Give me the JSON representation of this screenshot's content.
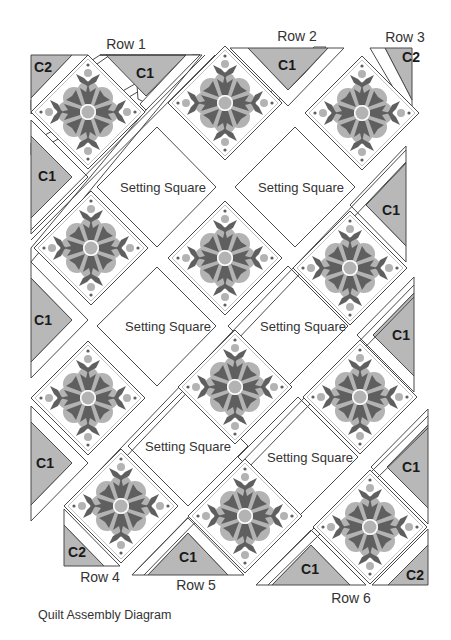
{
  "diagram": {
    "caption": "Quilt Assembly Diagram",
    "colors": {
      "outline": "#4a4a4a",
      "triangle_fill": "#b8b8b8",
      "sashing_fill": "#ffffff",
      "applique_dark": "#5f5f5f",
      "applique_light": "#b3b3b3",
      "block_bg": "#ffffff"
    },
    "row_labels": [
      {
        "text": "Row 1",
        "x": 126,
        "y": 44
      },
      {
        "text": "Row 2",
        "x": 297,
        "y": 36
      },
      {
        "text": "Row 3",
        "x": 405,
        "y": 37
      },
      {
        "text": "Row 4",
        "x": 100,
        "y": 577
      },
      {
        "text": "Row 5",
        "x": 196,
        "y": 585
      },
      {
        "text": "Row 6",
        "x": 351,
        "y": 598
      }
    ],
    "setting_square_label": "Setting Square",
    "setting_squares": [
      {
        "text": "Setting Square",
        "x": 163,
        "y": 187
      },
      {
        "text": "Setting Square",
        "x": 301,
        "y": 187
      },
      {
        "text": "Setting Square",
        "x": 168,
        "y": 326
      },
      {
        "text": "Setting Square",
        "x": 303,
        "y": 326
      },
      {
        "text": "Setting Square",
        "x": 188,
        "y": 446
      },
      {
        "text": "Setting Square",
        "x": 310,
        "y": 457
      }
    ],
    "triangle_labels": [
      {
        "text": "C2",
        "x": 43,
        "y": 67
      },
      {
        "text": "C1",
        "x": 145,
        "y": 73
      },
      {
        "text": "C1",
        "x": 287,
        "y": 65
      },
      {
        "text": "C2",
        "x": 411,
        "y": 57
      },
      {
        "text": "C1",
        "x": 47,
        "y": 176
      },
      {
        "text": "C1",
        "x": 391,
        "y": 210
      },
      {
        "text": "C1",
        "x": 43,
        "y": 320
      },
      {
        "text": "C1",
        "x": 401,
        "y": 335
      },
      {
        "text": "C1",
        "x": 45,
        "y": 463
      },
      {
        "text": "C1",
        "x": 411,
        "y": 467
      },
      {
        "text": "C2",
        "x": 77,
        "y": 552
      },
      {
        "text": "C1",
        "x": 188,
        "y": 557
      },
      {
        "text": "C1",
        "x": 310,
        "y": 569
      },
      {
        "text": "C2",
        "x": 415,
        "y": 575
      }
    ],
    "blocks": [
      {
        "x": 88,
        "y": 112
      },
      {
        "x": 225,
        "y": 103
      },
      {
        "x": 362,
        "y": 113
      },
      {
        "x": 91,
        "y": 248
      },
      {
        "x": 225,
        "y": 258
      },
      {
        "x": 350,
        "y": 268
      },
      {
        "x": 88,
        "y": 398
      },
      {
        "x": 235,
        "y": 387
      },
      {
        "x": 360,
        "y": 397
      },
      {
        "x": 121,
        "y": 506
      },
      {
        "x": 245,
        "y": 516
      },
      {
        "x": 370,
        "y": 527
      }
    ]
  }
}
